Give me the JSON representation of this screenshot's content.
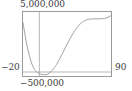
{
  "widget": {
    "name": "function-plot",
    "background_color": "#ffffff",
    "frame_color": "#9a9a9a",
    "curve_color": "#999999",
    "axis_color": "#9a9a9a",
    "label_color": "#3c3c3c"
  },
  "labels": {
    "y_max": "5,000,000",
    "y_min": "−500,000",
    "x_min": "−20",
    "x_max": "90"
  },
  "chart_data": {
    "type": "line",
    "title": "",
    "subtitle": "",
    "xlabel": "",
    "ylabel": "",
    "xlim": [
      -20,
      90
    ],
    "ylim": [
      -500000,
      5000000
    ],
    "grid": false,
    "legend": null,
    "axis_lines": {
      "x_axis_at_y": 0,
      "y_axis_at_x": 0
    },
    "tick_labels": {
      "x": [
        "−20",
        "90"
      ],
      "y": [
        "−500,000",
        "5,000,000"
      ]
    },
    "annotations": [
      "curve descends steeply from upper-left",
      "minimum slightly below y = 0 near x = 7",
      "rises through an S-shape to a plateau near y = 4,400,000",
      "small final rise at the right edge"
    ],
    "series": [
      {
        "name": "f(x)",
        "x": [
          -20.0,
          -18.0,
          -16.0,
          -14.0,
          -12.0,
          -10.0,
          -8.0,
          -6.0,
          -4.0,
          -2.0,
          0.0,
          2.0,
          4.0,
          6.0,
          8.0,
          10.0,
          12.0,
          14.0,
          16.0,
          18.0,
          20.0,
          24.0,
          28.0,
          32.0,
          36.0,
          40.0,
          44.0,
          48.0,
          52.0,
          56.0,
          60.0,
          64.0,
          68.0,
          72.0,
          76.0,
          80.0,
          84.0,
          88.0,
          90.0
        ],
        "y": [
          4120000,
          3280000,
          2520000,
          1860000,
          1300000,
          840000,
          480000,
          220000,
          50000,
          -60000,
          -130000,
          -180000,
          -210000,
          -225000,
          -215000,
          -175000,
          -100000,
          10000,
          150000,
          320000,
          520000,
          990000,
          1520000,
          2070000,
          2600000,
          3090000,
          3520000,
          3870000,
          4130000,
          4300000,
          4390000,
          4420000,
          4430000,
          4430000,
          4440000,
          4470000,
          4560000,
          4720000,
          4820000
        ]
      }
    ]
  }
}
